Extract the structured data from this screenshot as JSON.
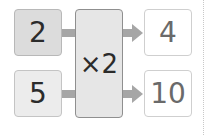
{
  "diagram": {
    "type": "function-machine",
    "inputs": [
      {
        "value": "2"
      },
      {
        "value": "5"
      }
    ],
    "operation": {
      "label": "×2"
    },
    "outputs": [
      {
        "value": "4"
      },
      {
        "value": "10"
      }
    ]
  },
  "colors": {
    "input1_fill": "#dcdcdc",
    "input2_fill": "#ececec",
    "operation_fill": "#e6e6e6",
    "output_fill": "#ffffff",
    "connector": "#a6a6a6"
  }
}
